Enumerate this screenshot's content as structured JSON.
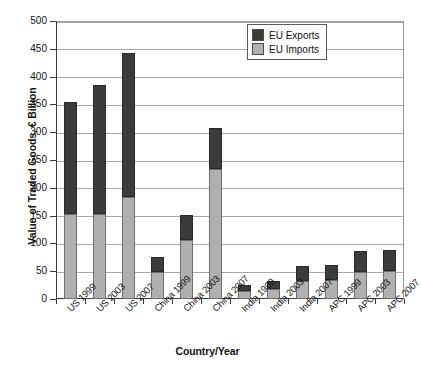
{
  "chart_data": {
    "type": "bar",
    "subtype": "stacked-vertical",
    "title": "",
    "xlabel": "Country/Year",
    "ylabel": "Value of Traded Goods, € Billion",
    "ylim": [
      0,
      500
    ],
    "ytick_step": 50,
    "yticks": [
      0,
      50,
      100,
      150,
      200,
      250,
      300,
      350,
      400,
      450,
      500
    ],
    "ytick_labels": [
      "0",
      "50",
      "100",
      "150",
      "200",
      "250",
      "300",
      "350",
      "400",
      "450",
      "500"
    ],
    "grid": "horizontal",
    "legend_position": "top-right",
    "categories": [
      "US 1999",
      "US 2003",
      "US 2007",
      "China 1999",
      "China 2003",
      "China 2007",
      "India 1999",
      "India 2003",
      "India 2007",
      "APC 1999",
      "APC 2003",
      "APC 2007"
    ],
    "series": [
      {
        "name": "EU Imports",
        "color": "#b0b0b0",
        "values": [
          153,
          153,
          184,
          48,
          107,
          234,
          15,
          18,
          33,
          35,
          48,
          50
        ]
      },
      {
        "name": "EU Exports",
        "color": "#3b3b3b",
        "values": [
          202,
          232,
          259,
          28,
          45,
          73,
          10,
          15,
          27,
          27,
          39,
          38
        ]
      }
    ],
    "totals": [
      355,
      385,
      443,
      76,
      152,
      307,
      25,
      33,
      60,
      62,
      87,
      88
    ]
  },
  "legend": {
    "items": [
      {
        "label": "EU Exports",
        "color": "#3b3b3b"
      },
      {
        "label": "EU Imports",
        "color": "#b0b0b0"
      }
    ]
  }
}
